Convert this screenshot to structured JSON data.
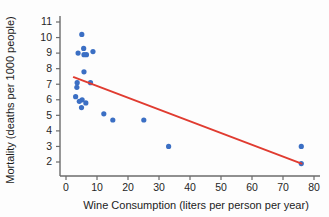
{
  "chart_data": {
    "type": "scatter",
    "title": "",
    "xlabel": "Wine Consumption (liters per person per year)",
    "ylabel": "Mortality (deaths per 1000 people)",
    "xlim": [
      0,
      82
    ],
    "ylim": [
      1.5,
      11.4
    ],
    "xticks": [
      0,
      10,
      20,
      30,
      40,
      50,
      60,
      70,
      80
    ],
    "yticks": [
      2,
      3,
      4,
      5,
      6,
      7,
      8,
      9,
      10,
      11
    ],
    "grid": false,
    "legend": null,
    "point_color": "#3b6fc4",
    "line_color": "#e03b30",
    "axis_color": "#6b6b6b",
    "marker_radius": 2.6,
    "points": [
      {
        "x": 5.1,
        "y": 10.2
      },
      {
        "x": 5.7,
        "y": 9.3
      },
      {
        "x": 3.9,
        "y": 9.0
      },
      {
        "x": 6.6,
        "y": 8.9
      },
      {
        "x": 5.8,
        "y": 8.9
      },
      {
        "x": 8.7,
        "y": 9.1
      },
      {
        "x": 5.8,
        "y": 7.8
      },
      {
        "x": 3.6,
        "y": 7.1
      },
      {
        "x": 7.9,
        "y": 7.1
      },
      {
        "x": 3.5,
        "y": 6.8
      },
      {
        "x": 3.1,
        "y": 6.2
      },
      {
        "x": 5.2,
        "y": 6.0
      },
      {
        "x": 4.3,
        "y": 5.9
      },
      {
        "x": 6.4,
        "y": 5.8
      },
      {
        "x": 5.0,
        "y": 5.5
      },
      {
        "x": 12.2,
        "y": 5.1
      },
      {
        "x": 15.1,
        "y": 4.7
      },
      {
        "x": 25.1,
        "y": 4.7
      },
      {
        "x": 33.1,
        "y": 3.0
      },
      {
        "x": 75.9,
        "y": 3.0
      },
      {
        "x": 75.9,
        "y": 1.9
      }
    ],
    "fit_line": {
      "label": "least-squares regression line",
      "x_start": 2.5,
      "y_start": 7.45,
      "x_end": 76.0,
      "y_end": 1.9
    }
  },
  "figure": {
    "name": "wine-consumption-vs-mortality-scatterplot"
  }
}
